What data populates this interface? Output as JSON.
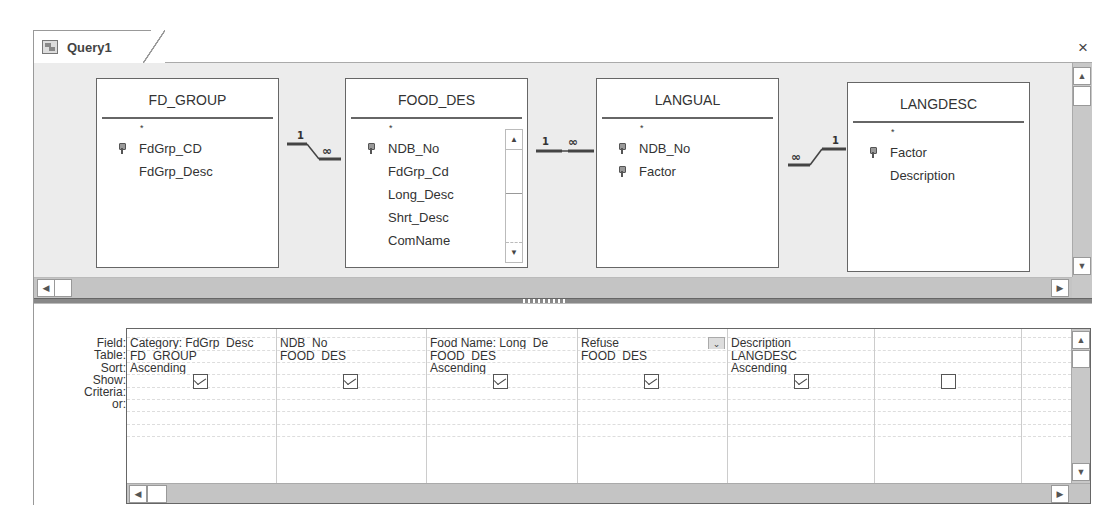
{
  "tab": {
    "title": "Query1",
    "icon": "query-icon",
    "close_label": "×"
  },
  "diagram": {
    "tables": [
      {
        "name": "FD_GROUP",
        "fields": [
          {
            "name": "*",
            "key": false
          },
          {
            "name": "FdGrp_CD",
            "key": true
          },
          {
            "name": "FdGrp_Desc",
            "key": false
          }
        ]
      },
      {
        "name": "FOOD_DES",
        "fields": [
          {
            "name": "*",
            "key": false
          },
          {
            "name": "NDB_No",
            "key": true
          },
          {
            "name": "FdGrp_Cd",
            "key": false
          },
          {
            "name": "Long_Desc",
            "key": false
          },
          {
            "name": "Shrt_Desc",
            "key": false
          },
          {
            "name": "ComName",
            "key": false
          }
        ],
        "has_scrollbar": true
      },
      {
        "name": "LANGUAL",
        "fields": [
          {
            "name": "*",
            "key": false
          },
          {
            "name": "NDB_No",
            "key": true
          },
          {
            "name": "Factor",
            "key": true
          }
        ]
      },
      {
        "name": "LANGDESC",
        "fields": [
          {
            "name": "*",
            "key": false
          },
          {
            "name": "Factor",
            "key": true
          },
          {
            "name": "Description",
            "key": false
          }
        ]
      }
    ],
    "joins": [
      {
        "from": "FD_GROUP",
        "to": "FOOD_DES",
        "left_label": "1",
        "right_label": "∞"
      },
      {
        "from": "FOOD_DES",
        "to": "LANGUAL",
        "left_label": "1",
        "right_label": "∞"
      },
      {
        "from": "LANGUAL",
        "to": "LANGDESC",
        "left_label": "∞",
        "right_label": "1"
      }
    ]
  },
  "grid": {
    "row_labels": [
      "Field:",
      "Table:",
      "Sort:",
      "Show:",
      "Criteria:",
      "or:"
    ],
    "columns": [
      {
        "field": "Category: FdGrp_Desc",
        "table": "FD_GROUP",
        "sort": "Ascending",
        "show": true
      },
      {
        "field": "NDB_No",
        "table": "FOOD_DES",
        "sort": "",
        "show": true
      },
      {
        "field": "Food Name: Long_De",
        "table": "FOOD_DES",
        "sort": "Ascending",
        "show": true
      },
      {
        "field": "Refuse",
        "table": "FOOD_DES",
        "sort": "",
        "show": true,
        "has_dropdown": true
      },
      {
        "field": "Description",
        "table": "LANGDESC",
        "sort": "Ascending",
        "show": true
      },
      {
        "field": "",
        "table": "",
        "sort": "",
        "show": false
      }
    ]
  },
  "scroll": {
    "up": "▲",
    "down": "▼",
    "left": "◀",
    "right": "▶"
  }
}
